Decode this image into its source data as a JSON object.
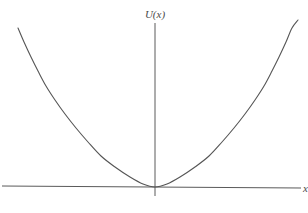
{
  "figure": {
    "name": "potential-energy-parabola",
    "background_color": "#ffffff",
    "width": 308,
    "height": 213
  },
  "labels": {
    "y_axis": "U(x)",
    "x_axis": "x"
  },
  "style": {
    "curve_color": "#555555",
    "axis_color": "#5a5a5a",
    "curve_width": 1.1,
    "axis_width": 1.0
  },
  "chart_data": {
    "type": "line",
    "title": "",
    "xlabel": "x",
    "ylabel": "U(x)",
    "grid": false,
    "legend": null,
    "annotations": [],
    "axes": {
      "y_axis_x_pixel": 155,
      "y_axis_top_pixel": 23,
      "y_axis_bottom_pixel": 196,
      "x_axis_left_point": [
        2,
        186
      ],
      "x_axis_right_point": [
        301,
        188
      ],
      "origin_pixel": [
        155,
        187
      ],
      "x_axis_tilted": true
    },
    "function": "U(x) = k*x^2",
    "vertex": [
      0,
      0
    ],
    "xlim": [
      -1.0,
      1.06
    ],
    "ylim": [
      0,
      1.16
    ],
    "x": [
      -1.0,
      -0.9,
      -0.8,
      -0.7,
      -0.6,
      -0.5,
      -0.4,
      -0.3,
      -0.2,
      -0.1,
      0.0,
      0.1,
      0.2,
      0.3,
      0.4,
      0.5,
      0.6,
      0.7,
      0.8,
      0.9,
      1.0,
      1.06
    ],
    "values": [
      1.16,
      0.94,
      0.74,
      0.57,
      0.42,
      0.29,
      0.185,
      0.104,
      0.046,
      0.012,
      0.0,
      0.012,
      0.046,
      0.104,
      0.185,
      0.29,
      0.42,
      0.57,
      0.74,
      0.94,
      1.16,
      1.3
    ],
    "curve_pixel_points": [
      [
        18,
        28
      ],
      [
        24,
        42
      ],
      [
        31,
        57
      ],
      [
        38,
        71
      ],
      [
        46,
        86
      ],
      [
        55,
        100
      ],
      [
        65,
        114
      ],
      [
        76,
        128
      ],
      [
        88,
        142
      ],
      [
        101,
        156
      ],
      [
        115,
        167
      ],
      [
        130,
        177
      ],
      [
        143,
        184
      ],
      [
        155,
        187
      ],
      [
        167,
        184
      ],
      [
        180,
        177
      ],
      [
        195,
        167
      ],
      [
        209,
        156
      ],
      [
        222,
        142
      ],
      [
        234,
        128
      ],
      [
        245,
        114
      ],
      [
        255,
        100
      ],
      [
        264,
        86
      ],
      [
        272,
        71
      ],
      [
        279,
        57
      ],
      [
        286,
        42
      ],
      [
        292,
        28
      ],
      [
        298,
        20
      ]
    ]
  }
}
